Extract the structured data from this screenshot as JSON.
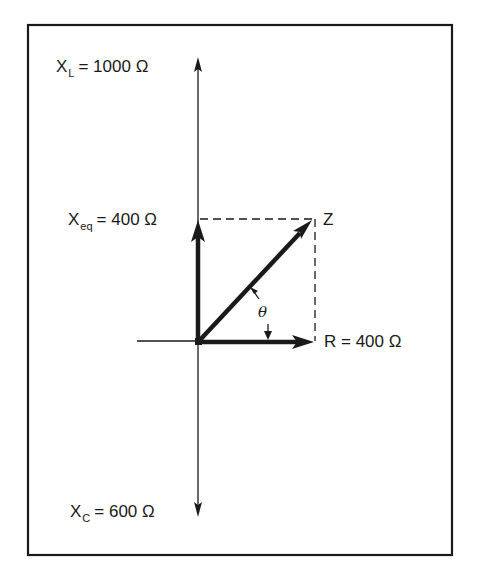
{
  "diagram": {
    "type": "impedance-phasor-diagram",
    "labels": {
      "xl": {
        "symbol": "X",
        "sub": "L",
        "value": "= 1000 Ω"
      },
      "xeq": {
        "symbol": "X",
        "sub": "eq",
        "value": "= 400 Ω"
      },
      "xc": {
        "symbol": "X",
        "sub": "C",
        "value": "= 600 Ω"
      },
      "r": {
        "text": "R = 400 Ω"
      },
      "z": {
        "text": "Z"
      },
      "angle": {
        "text": "θ"
      }
    },
    "values": {
      "XL_ohms": 1000,
      "XC_ohms": 600,
      "Xeq_ohms": 400,
      "R_ohms": 400
    },
    "colors": {
      "ink": "#1a1a1a",
      "background": "#ffffff"
    }
  }
}
